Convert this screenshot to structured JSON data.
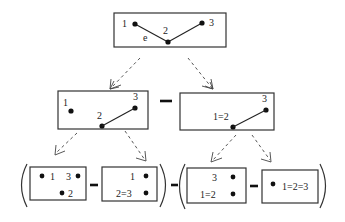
{
  "top_graph": {
    "nodes": [
      {
        "id": "1",
        "label": "1"
      },
      {
        "id": "2",
        "label": "2"
      },
      {
        "id": "3",
        "label": "3"
      }
    ],
    "edges": [
      {
        "from": "1",
        "to": "2",
        "label": "e"
      },
      {
        "from": "2",
        "to": "3",
        "label": ""
      }
    ]
  },
  "level2": {
    "left": {
      "labels": [
        "1",
        "2",
        "3"
      ],
      "edges": [
        "2-3"
      ]
    },
    "operator": "−",
    "right": {
      "labels": [
        "1=2",
        "3"
      ],
      "edges": [
        "1=2 - 3"
      ]
    }
  },
  "level3": {
    "group_left": {
      "box_a": {
        "labels": [
          "1",
          "3",
          "2"
        ]
      },
      "operator": "−",
      "box_b": {
        "labels": [
          "1",
          "2=3"
        ]
      }
    },
    "between_operator": "−",
    "group_right": {
      "box_a": {
        "labels": [
          "3",
          "1=2"
        ]
      },
      "operator": "−",
      "box_b": {
        "labels": [
          "1=2=3"
        ]
      }
    }
  }
}
